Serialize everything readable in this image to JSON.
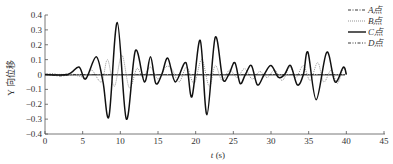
{
  "chart_data": {
    "type": "line",
    "title": "",
    "xlabel": "t (s)",
    "xlabel_var": "t",
    "xlabel_unit": "(s)",
    "ylabel": "Y向位移",
    "xlim": [
      0,
      45
    ],
    "ylim": [
      -0.4,
      0.4
    ],
    "x_ticks": [
      0,
      5,
      10,
      15,
      20,
      25,
      30,
      35,
      40,
      45
    ],
    "y_ticks": [
      0.4,
      0.3,
      0.2,
      0.1,
      0,
      -0.1,
      -0.2,
      -0.3,
      -0.4
    ],
    "y_tick_labels": [
      "0.4",
      "0.3",
      "0.2",
      "0.1",
      "0",
      "−0.1",
      "−0.2",
      "−0.3",
      "−0.4"
    ],
    "grid": false,
    "legend_position": "upper right",
    "series": [
      {
        "name": "A点",
        "style": "dash-dot",
        "color": "#333333",
        "x": [
          0,
          1,
          2,
          3,
          4,
          5,
          8,
          10,
          15,
          20,
          25,
          30,
          35,
          40
        ],
        "y": [
          0,
          -0.005,
          -0.01,
          -0.005,
          0,
          0,
          0,
          0,
          0,
          0,
          0,
          0,
          0,
          0
        ]
      },
      {
        "name": "B点",
        "style": "dotted",
        "color": "#888888",
        "x": [
          0,
          3,
          4.5,
          5.5,
          6.2,
          7.5,
          8.3,
          9.2,
          10.2,
          11.2,
          12.2,
          13.0,
          14.0,
          15.0,
          16.0,
          16.8,
          17.8,
          18.8,
          19.8,
          20.8,
          21.8,
          22.6,
          23.5,
          24.5,
          25.5,
          26.5,
          27.5,
          28.5,
          29.5,
          30.5,
          31.5,
          32.5,
          33.3,
          34.3,
          35.2,
          36.2,
          37.0,
          38.0,
          38.8,
          39.6,
          40
        ],
        "y": [
          0,
          0,
          -0.01,
          -0.02,
          0.03,
          -0.05,
          0.1,
          -0.08,
          0.13,
          -0.09,
          0.04,
          -0.02,
          0.05,
          -0.03,
          0.05,
          0.04,
          -0.05,
          0.05,
          -0.06,
          0.1,
          -0.08,
          0.06,
          -0.04,
          0.03,
          -0.02,
          0.04,
          -0.03,
          0.02,
          -0.02,
          0.03,
          -0.04,
          0.05,
          -0.02,
          0.06,
          -0.04,
          0.08,
          -0.05,
          0.03,
          -0.06,
          0.04,
          0.0
        ]
      },
      {
        "name": "C点",
        "style": "solid",
        "color": "#111111",
        "x": [
          0,
          3,
          4.5,
          5.4,
          6.8,
          7.7,
          8.5,
          9.6,
          10.8,
          12.0,
          13.2,
          14.0,
          14.7,
          15.5,
          16.3,
          17.3,
          18.7,
          19.5,
          20.6,
          21.5,
          22.6,
          23.6,
          24.4,
          25.2,
          25.9,
          26.6,
          27.4,
          28.2,
          29.1,
          30.0,
          31.0,
          31.8,
          32.6,
          33.5,
          34.3,
          34.9,
          36.0,
          37.4,
          38.5,
          39.6,
          40
        ],
        "y": [
          0,
          0,
          0.05,
          -0.03,
          0.12,
          -0.05,
          -0.28,
          0.35,
          -0.3,
          0.16,
          -0.05,
          0.12,
          -0.06,
          0.0,
          0.11,
          -0.05,
          0.08,
          -0.15,
          0.23,
          -0.27,
          0.25,
          -0.03,
          0.0,
          0.08,
          -0.06,
          0.0,
          0.06,
          -0.07,
          0.0,
          0.06,
          -0.02,
          0.0,
          0.06,
          -0.07,
          0.0,
          0.15,
          -0.17,
          0.15,
          -0.05,
          0.05,
          0.0
        ]
      },
      {
        "name": "D点",
        "style": "dash-dot-dot",
        "color": "#333333",
        "x": [
          0,
          1,
          2,
          3,
          4,
          5,
          10,
          15,
          20,
          25,
          30,
          35,
          40
        ],
        "y": [
          0,
          0.005,
          -0.005,
          0.003,
          0,
          0,
          0,
          0,
          0,
          0,
          0,
          0,
          0
        ]
      }
    ]
  },
  "legend": {
    "items": [
      {
        "label": "A点",
        "style": "dash-dot"
      },
      {
        "label": "B点",
        "style": "dotted"
      },
      {
        "label": "C点",
        "style": "solid"
      },
      {
        "label": "D点",
        "style": "dash-dot-dot"
      }
    ]
  },
  "axes": {
    "x_title_var": "t",
    "x_title_unit": " (s)",
    "y_title": "Y 向位移"
  }
}
